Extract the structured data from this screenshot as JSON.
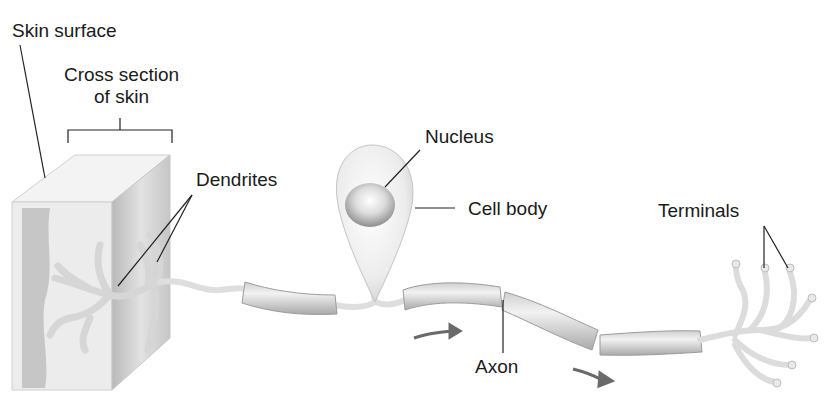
{
  "diagram": {
    "labels": {
      "skin_surface": "Skin surface",
      "cross_section_line1": "Cross section",
      "cross_section_line2": "of skin",
      "dendrites": "Dendrites",
      "nucleus": "Nucleus",
      "cell_body": "Cell body",
      "terminals": "Terminals",
      "axon": "Axon"
    },
    "colors": {
      "text": "#1a1a1a",
      "leader_line": "#222222",
      "neuron_fill": "#e6e6e6",
      "myelin_fill": "#d9d9d9",
      "skin_face": "#efefef",
      "skin_side": "#c8c8c8",
      "arrow": "#6a6a6a"
    }
  }
}
